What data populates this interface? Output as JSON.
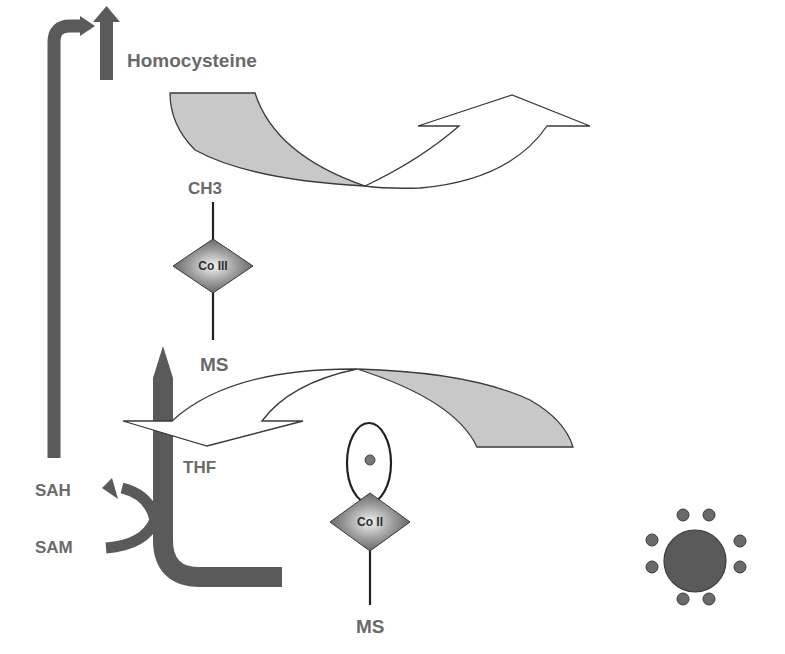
{
  "diagram": {
    "labels": {
      "homocysteine": "Homocysteine",
      "ch3": "CH3",
      "co3": "Co III",
      "ms_top": "MS",
      "thf": "THF",
      "sah": "SAH",
      "sam": "SAM",
      "co2": "Co II",
      "ms_bottom": "MS"
    },
    "colors": {
      "dark_arrow": "#5a5a5a",
      "light_fill": "#c8c8c8",
      "outline": "#3a3a3a",
      "label": "#6a6a6a"
    },
    "electron_cluster": {
      "outer_dots": 8
    }
  }
}
